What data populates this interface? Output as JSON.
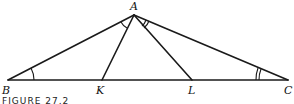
{
  "figure": {
    "caption": "FIGURE 27.2",
    "stroke_color": "#1a1a1a",
    "points": {
      "A": {
        "label": "A",
        "x": 134,
        "y": 15
      },
      "B": {
        "label": "B",
        "x": 8,
        "y": 80
      },
      "K": {
        "label": "K",
        "x": 102,
        "y": 80
      },
      "L": {
        "label": "L",
        "x": 192,
        "y": 80
      },
      "C": {
        "label": "C",
        "x": 288,
        "y": 80
      }
    },
    "segments": [
      "AB",
      "AC",
      "BC",
      "AK",
      "AL"
    ],
    "angle_marks": [
      {
        "angle": "ABC",
        "arcs": 1
      },
      {
        "angle": "BAK",
        "arcs": 1
      },
      {
        "angle": "ACB",
        "arcs": 2
      },
      {
        "angle": "LAC",
        "arcs": 2
      }
    ]
  }
}
